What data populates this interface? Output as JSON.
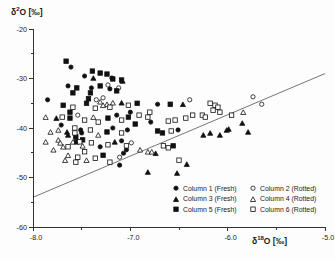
{
  "chart_data": {
    "type": "scatter",
    "title": "",
    "xlabel": "δ18O [‰]",
    "ylabel": "δ2O [‰]",
    "xlabel_parts": {
      "delta": "δ",
      "sup": "18",
      "rest": "O [‰]"
    },
    "ylabel_parts": {
      "delta": "δ",
      "sup": "2",
      "rest": "O [‰]"
    },
    "xlim": [
      -8.0,
      -5.0
    ],
    "ylim": [
      -60,
      -20
    ],
    "grid": false,
    "legend_position": "inside-bottom-right",
    "xticks": [
      {
        "value": -8.0,
        "label": "-8.0"
      },
      {
        "value": -7.0,
        "label": "-7.0"
      },
      {
        "value": -6.0,
        "label": "-6.0"
      },
      {
        "value": -5.0,
        "label": "-5.0"
      }
    ],
    "minor_xticks": [
      -7.5,
      -6.5,
      -5.5
    ],
    "yticks": [
      {
        "value": -20,
        "label": "-20"
      },
      {
        "value": -30,
        "label": "-30"
      },
      {
        "value": -40,
        "label": "-40"
      },
      {
        "value": -50,
        "label": "-50"
      },
      {
        "value": -60,
        "label": "-60"
      }
    ],
    "minor_yticks": [
      -25,
      -35,
      -45,
      -55
    ],
    "trend_line": {
      "x1": -8.0,
      "y1": -54,
      "x2": -5.0,
      "y2": -29
    },
    "marker_color": "#111111",
    "line_color": "#666666",
    "series": [
      {
        "name": "Column 1 (Fresh)",
        "marker": "circle",
        "fill": "filled",
        "points": [
          [
            -7.61,
            -27.7
          ],
          [
            -7.47,
            -29.5
          ],
          [
            -7.19,
            -29.9
          ],
          [
            -7.64,
            -31.5
          ],
          [
            -7.4,
            -31.9
          ],
          [
            -7.21,
            -32.1
          ],
          [
            -7.85,
            -34.3
          ],
          [
            -7.14,
            -37.4
          ],
          [
            -7.71,
            -39.4
          ],
          [
            -7.51,
            -40.4
          ],
          [
            -7.5,
            -41.0
          ],
          [
            -7.18,
            -40.0
          ],
          [
            -7.03,
            -40.4
          ],
          [
            -7.31,
            -43.8
          ],
          [
            -7.0,
            -36.8
          ],
          [
            -6.72,
            -35.2
          ],
          [
            -6.79,
            -38.8
          ],
          [
            -6.51,
            -40.4
          ],
          [
            -7.09,
            -42.6
          ],
          [
            -7.04,
            -44.4
          ],
          [
            -7.07,
            -45.1
          ],
          [
            -7.11,
            -47.5
          ]
        ]
      },
      {
        "name": "Column 2 (Rotted)",
        "marker": "circle",
        "fill": "open",
        "points": [
          [
            -7.23,
            -31.3
          ],
          [
            -7.12,
            -31.9
          ],
          [
            -7.35,
            -34.3
          ],
          [
            -7.28,
            -33.9
          ],
          [
            -7.54,
            -37.4
          ],
          [
            -6.99,
            -43.0
          ],
          [
            -7.11,
            -45.9
          ],
          [
            -6.39,
            -34.3
          ],
          [
            -5.74,
            -33.7
          ],
          [
            -5.65,
            -35.2
          ]
        ]
      },
      {
        "name": "Column 3 (Fresh)",
        "marker": "triangle",
        "fill": "filled",
        "points": [
          [
            -7.38,
            -29.9
          ],
          [
            -7.08,
            -30.5
          ],
          [
            -7.09,
            -34.9
          ],
          [
            -6.46,
            -35.2
          ],
          [
            -7.76,
            -38.0
          ],
          [
            -7.65,
            -40.8
          ],
          [
            -7.64,
            -41.4
          ],
          [
            -7.16,
            -42.8
          ],
          [
            -6.74,
            -45.1
          ],
          [
            -6.82,
            -48.9
          ],
          [
            -6.52,
            -49.1
          ],
          [
            -6.42,
            -47.3
          ],
          [
            -6.25,
            -41.4
          ],
          [
            -6.18,
            -41.0
          ],
          [
            -6.08,
            -41.4
          ],
          [
            -6.01,
            -40.4
          ],
          [
            -5.99,
            -40.2
          ],
          [
            -5.85,
            -39.0
          ],
          [
            -5.79,
            -40.8
          ]
        ]
      },
      {
        "name": "Column 4 (Rotted)",
        "marker": "triangle",
        "fill": "open",
        "points": [
          [
            -7.31,
            -34.7
          ],
          [
            -7.24,
            -35.2
          ],
          [
            -7.18,
            -34.9
          ],
          [
            -7.28,
            -35.4
          ],
          [
            -7.38,
            -37.8
          ],
          [
            -7.87,
            -37.8
          ],
          [
            -7.33,
            -41.4
          ],
          [
            -7.74,
            -40.4
          ],
          [
            -7.82,
            -40.8
          ],
          [
            -7.87,
            -42.8
          ],
          [
            -7.74,
            -42.4
          ],
          [
            -7.72,
            -43.0
          ],
          [
            -7.79,
            -44.4
          ],
          [
            -7.69,
            -43.8
          ],
          [
            -7.64,
            -45.5
          ],
          [
            -7.59,
            -42.8
          ],
          [
            -7.49,
            -43.6
          ],
          [
            -7.45,
            -46.5
          ],
          [
            -7.67,
            -46.5
          ],
          [
            -6.9,
            -44.4
          ],
          [
            -6.82,
            -44.8
          ],
          [
            -6.78,
            -44.8
          ],
          [
            -5.84,
            -36.8
          ]
        ]
      },
      {
        "name": "Column 5 (Fresh)",
        "marker": "square",
        "fill": "filled",
        "points": [
          [
            -7.66,
            -26.5
          ],
          [
            -7.39,
            -28.5
          ],
          [
            -7.31,
            -28.9
          ],
          [
            -7.24,
            -29.1
          ],
          [
            -7.18,
            -30.1
          ],
          [
            -7.09,
            -30.3
          ],
          [
            -7.55,
            -31.9
          ],
          [
            -7.31,
            -31.5
          ],
          [
            -7.14,
            -32.5
          ],
          [
            -7.59,
            -32.9
          ],
          [
            -7.41,
            -32.9
          ],
          [
            -7.43,
            -34.1
          ],
          [
            -7.69,
            -35.4
          ],
          [
            -7.45,
            -35.0
          ],
          [
            -6.93,
            -35.0
          ],
          [
            -6.59,
            -35.2
          ],
          [
            -7.62,
            -36.8
          ],
          [
            -7.62,
            -38.0
          ],
          [
            -7.23,
            -38.0
          ],
          [
            -7.02,
            -37.8
          ],
          [
            -6.95,
            -39.2
          ],
          [
            -7.24,
            -40.8
          ],
          [
            -6.72,
            -40.6
          ],
          [
            -6.67,
            -41.0
          ],
          [
            -7.56,
            -41.8
          ],
          [
            -7.55,
            -42.8
          ],
          [
            -7.49,
            -42.4
          ],
          [
            -7.28,
            -45.5
          ],
          [
            -6.56,
            -43.6
          ]
        ]
      },
      {
        "name": "Column 6 (Rotted)",
        "marker": "square",
        "fill": "open",
        "points": [
          [
            -7.59,
            -35.8
          ],
          [
            -7.36,
            -36.0
          ],
          [
            -7.21,
            -35.8
          ],
          [
            -7.02,
            -35.4
          ],
          [
            -7.7,
            -37.8
          ],
          [
            -7.47,
            -38.4
          ],
          [
            -7.33,
            -38.8
          ],
          [
            -7.09,
            -38.4
          ],
          [
            -7.57,
            -40.0
          ],
          [
            -7.41,
            -40.4
          ],
          [
            -7.09,
            -41.0
          ],
          [
            -7.57,
            -41.0
          ],
          [
            -7.52,
            -42.8
          ],
          [
            -7.64,
            -43.8
          ],
          [
            -7.4,
            -43.0
          ],
          [
            -7.23,
            -43.4
          ],
          [
            -7.47,
            -44.8
          ],
          [
            -7.54,
            -45.9
          ],
          [
            -7.36,
            -46.1
          ],
          [
            -7.21,
            -46.9
          ],
          [
            -7.56,
            -46.9
          ],
          [
            -6.91,
            -37.4
          ],
          [
            -6.8,
            -36.8
          ],
          [
            -6.82,
            -37.8
          ],
          [
            -6.61,
            -38.6
          ],
          [
            -6.54,
            -38.4
          ],
          [
            -6.43,
            -38.0
          ],
          [
            -6.36,
            -37.4
          ],
          [
            -6.58,
            -40.6
          ],
          [
            -6.66,
            -43.6
          ],
          [
            -6.61,
            -44.0
          ],
          [
            -6.5,
            -46.5
          ],
          [
            -6.18,
            -35.0
          ],
          [
            -6.13,
            -35.4
          ],
          [
            -6.1,
            -35.8
          ],
          [
            -6.15,
            -36.4
          ],
          [
            -6.08,
            -36.8
          ],
          [
            -6.26,
            -37.4
          ],
          [
            -6.23,
            -37.8
          ],
          [
            -5.96,
            -37.4
          ],
          [
            -7.04,
            -43.6
          ]
        ]
      }
    ]
  }
}
